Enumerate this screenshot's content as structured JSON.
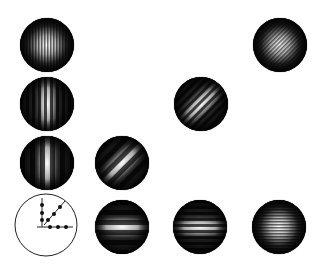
{
  "figure": {
    "background": "#ffffff",
    "pattern_color_dark": "#1a1a1a",
    "pattern_color_light": "#ffffff",
    "patterns": [
      {
        "id": "p1",
        "row": 1,
        "col": 1,
        "cx": 47,
        "cy": 45,
        "stripe_orientation": "vertical",
        "stripe_type": "fine",
        "angle": 90
      },
      {
        "id": "p2",
        "row": 1,
        "col": 4,
        "cx": 280,
        "cy": 45,
        "stripe_orientation": "diagonal",
        "stripe_type": "fine",
        "angle": 45
      },
      {
        "id": "p3",
        "row": 2,
        "col": 1,
        "cx": 47,
        "cy": 104,
        "stripe_orientation": "vertical",
        "stripe_type": "medium",
        "angle": 90
      },
      {
        "id": "p4",
        "row": 2,
        "col": 3,
        "cx": 201,
        "cy": 104,
        "stripe_orientation": "diagonal",
        "stripe_type": "medium",
        "angle": 45
      },
      {
        "id": "p5",
        "row": 3,
        "col": 1,
        "cx": 47,
        "cy": 163,
        "stripe_orientation": "vertical",
        "stripe_type": "coarse",
        "angle": 90
      },
      {
        "id": "p6",
        "row": 3,
        "col": 2,
        "cx": 122,
        "cy": 163,
        "stripe_orientation": "diagonal",
        "stripe_type": "coarse",
        "angle": 45
      },
      {
        "id": "p7",
        "row": 4,
        "col": 2,
        "cx": 122,
        "cy": 227,
        "stripe_orientation": "horizontal",
        "stripe_type": "coarse",
        "angle": 0
      },
      {
        "id": "p8",
        "row": 4,
        "col": 3,
        "cx": 200,
        "cy": 227,
        "stripe_orientation": "horizontal",
        "stripe_type": "medium",
        "angle": 0
      },
      {
        "id": "p9",
        "row": 4,
        "col": 4,
        "cx": 279,
        "cy": 227,
        "stripe_orientation": "horizontal",
        "stripe_type": "fine",
        "angle": 0
      }
    ],
    "key_diagram": {
      "cx": 46,
      "cy": 225,
      "r": 31,
      "origin": [
        42,
        227
      ],
      "directions": [
        "vertical",
        "diagonal",
        "horizontal"
      ],
      "dots_per_direction": 3
    }
  }
}
